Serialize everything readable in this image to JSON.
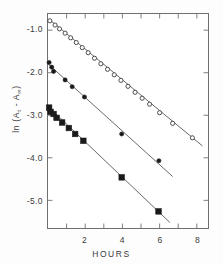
{
  "chart_data": {
    "type": "scatter",
    "title": "",
    "xlabel": "HOURS",
    "ylabel": "ln (At - A∞)",
    "ylabel_parts": {
      "prefix": "ln (A",
      "sub1": "t",
      "mid": " - A",
      "sub2": "∞",
      "suffix": ")"
    },
    "xlim": [
      0,
      8.6
    ],
    "ylim": [
      -5.65,
      -0.62
    ],
    "xticks": [
      1,
      2,
      3,
      4,
      5,
      6,
      7,
      8
    ],
    "xticklabels": [
      "",
      "2",
      "",
      "4",
      "",
      "6",
      "",
      "8"
    ],
    "yticks": [
      -1.0,
      -2.0,
      -3.0,
      -4.0,
      -5.0
    ],
    "yticklabels": [
      "-1.0",
      "-2.0",
      "-3.0",
      "-4.0",
      "-5.0"
    ],
    "grid": false,
    "legend": "none",
    "frame": "box",
    "tick_direction": "in",
    "series": [
      {
        "name": "open-circles",
        "marker": "open-circle",
        "color": "#3a3a3a",
        "fill": "#ffffff",
        "marker_size": 4.2,
        "points": [
          {
            "x": 0.1,
            "y": -0.78
          },
          {
            "x": 0.38,
            "y": -0.88
          },
          {
            "x": 0.62,
            "y": -0.97
          },
          {
            "x": 0.92,
            "y": -1.07
          },
          {
            "x": 1.22,
            "y": -1.18
          },
          {
            "x": 1.52,
            "y": -1.29
          },
          {
            "x": 1.84,
            "y": -1.41
          },
          {
            "x": 2.16,
            "y": -1.53
          },
          {
            "x": 2.5,
            "y": -1.66
          },
          {
            "x": 2.84,
            "y": -1.79
          },
          {
            "x": 3.2,
            "y": -1.92
          },
          {
            "x": 3.56,
            "y": -2.05
          },
          {
            "x": 3.92,
            "y": -2.18
          },
          {
            "x": 4.3,
            "y": -2.32
          },
          {
            "x": 4.68,
            "y": -2.46
          },
          {
            "x": 5.06,
            "y": -2.6
          },
          {
            "x": 5.46,
            "y": -2.74
          },
          {
            "x": 6.0,
            "y": -2.94
          },
          {
            "x": 6.7,
            "y": -3.19
          },
          {
            "x": 7.76,
            "y": -3.53
          }
        ],
        "fit_line": {
          "x1": 0.05,
          "y1": -0.74,
          "x2": 8.3,
          "y2": -3.72
        }
      },
      {
        "name": "filled-circles",
        "marker": "filled-circle",
        "color": "#1a1a1a",
        "fill": "#1a1a1a",
        "marker_size": 4.2,
        "points": [
          {
            "x": 0.06,
            "y": -1.76
          },
          {
            "x": 0.2,
            "y": -1.87
          },
          {
            "x": 0.3,
            "y": -1.97
          },
          {
            "x": 0.92,
            "y": -2.17
          },
          {
            "x": 1.3,
            "y": -2.33
          },
          {
            "x": 1.96,
            "y": -2.57
          },
          {
            "x": 3.96,
            "y": -3.44
          },
          {
            "x": 5.96,
            "y": -4.07
          }
        ],
        "fit_line": {
          "x1": 0.02,
          "y1": -1.8,
          "x2": 6.7,
          "y2": -4.44
        }
      },
      {
        "name": "filled-squares",
        "marker": "filled-square",
        "color": "#1a1a1a",
        "fill": "#1a1a1a",
        "marker_size": 5.6,
        "points": [
          {
            "x": 0.06,
            "y": -2.82
          },
          {
            "x": 0.14,
            "y": -2.92
          },
          {
            "x": 0.3,
            "y": -2.97
          },
          {
            "x": 0.46,
            "y": -3.06
          },
          {
            "x": 0.76,
            "y": -3.17
          },
          {
            "x": 1.12,
            "y": -3.3
          },
          {
            "x": 1.46,
            "y": -3.44
          },
          {
            "x": 1.9,
            "y": -3.6
          },
          {
            "x": 3.96,
            "y": -4.46
          },
          {
            "x": 5.94,
            "y": -5.26
          }
        ],
        "fit_line": {
          "x1": 0.02,
          "y1": -2.8,
          "x2": 6.55,
          "y2": -5.52
        }
      }
    ]
  }
}
